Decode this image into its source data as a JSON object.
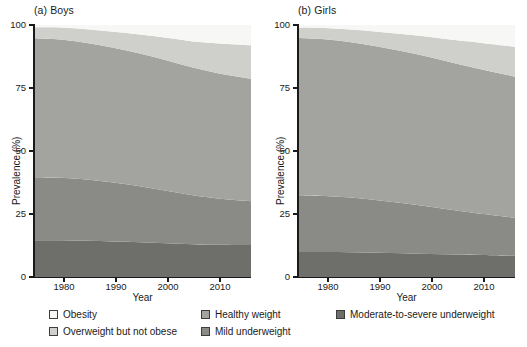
{
  "figure": {
    "axis_title_y": "Prevalence (%)",
    "axis_title_x": "Year"
  },
  "panels": [
    {
      "title": "(a) Boys"
    },
    {
      "title": "(b) Girls"
    }
  ],
  "axes": {
    "y_ticks": [
      "0",
      "25",
      "50",
      "75",
      "100"
    ],
    "x_ticks": [
      "1980",
      "1990",
      "2000",
      "2010"
    ]
  },
  "legend": {
    "items": [
      {
        "label": "Obesity",
        "color": "#f7f7f5"
      },
      {
        "label": "Overweight but not obese",
        "color": "#cfcfcb"
      },
      {
        "label": "Healthy weight",
        "color": "#a3a3a0"
      },
      {
        "label": "Mild underweight",
        "color": "#8a8a87"
      },
      {
        "label": "Moderate-to-severe underweight",
        "color": "#6e6e6b"
      }
    ]
  },
  "chart_data": {
    "type": "area",
    "xlabel": "Year",
    "ylabel": "Prevalence (%)",
    "xlim": [
      1975,
      2016
    ],
    "ylim": [
      0,
      100
    ],
    "grid": false,
    "stacked": true,
    "stack_order_bottom_to_top": [
      "Moderate-to-severe underweight",
      "Mild underweight",
      "Healthy weight",
      "Overweight but not obese",
      "Obesity"
    ],
    "legend_position": "bottom",
    "panels": [
      {
        "name": "(a) Boys",
        "x": [
          1975,
          1980,
          1985,
          1990,
          1995,
          2000,
          2005,
          2010,
          2016
        ],
        "series": [
          {
            "name": "Moderate-to-severe underweight",
            "color": "#6e6e6b",
            "values": [
              14.6,
              14.6,
              14.4,
              14.1,
              13.8,
              13.4,
              13.0,
              12.8,
              12.7
            ]
          },
          {
            "name": "Mild underweight",
            "color": "#8a8a87",
            "values": [
              25.0,
              24.8,
              24.3,
              23.4,
              22.2,
              20.8,
              19.4,
              18.3,
              17.4
            ]
          },
          {
            "name": "Healthy weight",
            "color": "#a3a3a0",
            "values": [
              55.1,
              54.8,
              54.2,
              53.5,
              52.7,
              51.8,
              50.7,
              49.7,
              48.6
            ]
          },
          {
            "name": "Overweight but not obese",
            "color": "#cfcfcb",
            "values": [
              4.4,
              4.8,
              5.4,
              6.3,
              7.5,
              8.9,
              10.4,
              11.9,
              13.3
            ]
          },
          {
            "name": "Obesity",
            "color": "#f7f7f5",
            "values": [
              0.9,
              1.0,
              1.7,
              2.7,
              3.8,
              5.1,
              6.5,
              7.3,
              8.0
            ]
          }
        ],
        "cumulative_top_edges": {
          "moderate_to_severe_underweight": [
            14.6,
            14.6,
            14.4,
            14.1,
            13.8,
            13.4,
            13.0,
            12.8,
            12.7
          ],
          "mild_underweight": [
            39.6,
            39.4,
            38.7,
            37.5,
            36.0,
            34.2,
            32.4,
            31.1,
            30.1
          ],
          "healthy_weight": [
            94.7,
            94.2,
            92.9,
            91.0,
            88.7,
            86.0,
            83.1,
            80.8,
            78.7
          ],
          "overweight_but_not_obese": [
            99.1,
            99.0,
            98.3,
            97.3,
            96.2,
            94.9,
            93.5,
            92.7,
            92.0
          ],
          "obesity": [
            100,
            100,
            100,
            100,
            100,
            100,
            100,
            100,
            100
          ]
        }
      },
      {
        "name": "(b) Girls",
        "x": [
          1975,
          1980,
          1985,
          1990,
          1995,
          2000,
          2005,
          2010,
          2016
        ],
        "series": [
          {
            "name": "Moderate-to-severe underweight",
            "color": "#6e6e6b",
            "values": [
              9.9,
              9.9,
              9.8,
              9.6,
              9.4,
              9.1,
              8.9,
              8.7,
              8.4
            ]
          },
          {
            "name": "Mild underweight",
            "color": "#8a8a87",
            "values": [
              22.5,
              22.2,
              21.7,
              20.9,
              19.9,
              18.8,
              17.5,
              16.3,
              15.1
            ]
          },
          {
            "name": "Healthy weight",
            "color": "#a3a3a0",
            "values": [
              62.4,
              62.2,
              61.7,
              61.0,
              60.2,
              59.3,
              58.2,
              57.2,
              56.0
            ]
          },
          {
            "name": "Overweight but not obese",
            "color": "#cfcfcb",
            "values": [
              4.2,
              4.5,
              5.0,
              5.8,
              6.8,
              8.0,
              9.3,
              10.6,
              11.9
            ]
          },
          {
            "name": "Obesity",
            "color": "#f7f7f5",
            "values": [
              1.0,
              1.2,
              1.8,
              2.7,
              3.7,
              4.8,
              6.1,
              7.2,
              8.6
            ]
          }
        ],
        "cumulative_top_edges": {
          "moderate_to_severe_underweight": [
            9.9,
            9.9,
            9.8,
            9.6,
            9.4,
            9.1,
            8.9,
            8.7,
            8.4
          ],
          "mild_underweight": [
            32.4,
            32.1,
            31.5,
            30.5,
            29.3,
            27.9,
            26.4,
            25.0,
            23.5
          ],
          "healthy_weight": [
            94.8,
            94.3,
            93.2,
            91.5,
            89.5,
            87.2,
            84.6,
            82.2,
            79.5
          ],
          "overweight_but_not_obese": [
            99.0,
            98.8,
            98.2,
            97.3,
            96.3,
            95.2,
            93.9,
            92.8,
            91.4
          ],
          "obesity": [
            100,
            100,
            100,
            100,
            100,
            100,
            100,
            100,
            100
          ]
        }
      }
    ]
  }
}
